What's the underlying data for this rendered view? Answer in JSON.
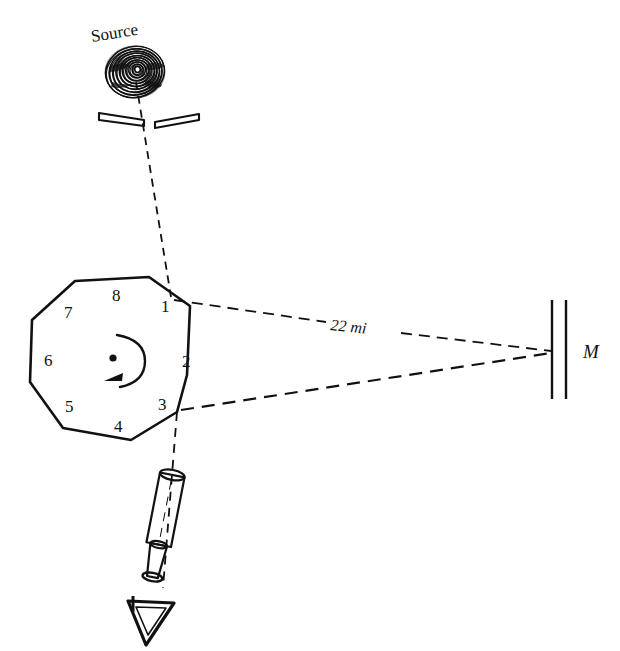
{
  "figure": {
    "title_text": "Source",
    "mirror_label": "M",
    "distance_label": "22 mi",
    "octagon_faces": [
      {
        "id": "1",
        "label": "1",
        "x": 161,
        "y": 312
      },
      {
        "id": "2",
        "label": "2",
        "x": 182,
        "y": 361
      },
      {
        "id": "3",
        "label": "3",
        "x": 158,
        "y": 410
      },
      {
        "id": "4",
        "label": "4",
        "x": 114,
        "y": 431
      },
      {
        "id": "5",
        "label": "5",
        "x": 65,
        "y": 411
      },
      {
        "id": "6",
        "label": "6",
        "x": 44,
        "y": 365
      },
      {
        "id": "7",
        "label": "7",
        "x": 64,
        "y": 316
      },
      {
        "id": "8",
        "label": "8",
        "x": 112,
        "y": 299
      }
    ],
    "colors": {
      "ink": "#111111",
      "background": "#ffffff"
    },
    "elements": {
      "source_name": "light-source-spiral",
      "slit_name": "slit-aperture",
      "octagon_name": "rotating-octagonal-mirror",
      "rotation_name": "rotation-direction-arrow",
      "center_name": "rotation-axis-dot",
      "mirror_name": "distant-fixed-mirror",
      "telescope_name": "observing-telescope",
      "eye_name": "observer-eye"
    }
  }
}
